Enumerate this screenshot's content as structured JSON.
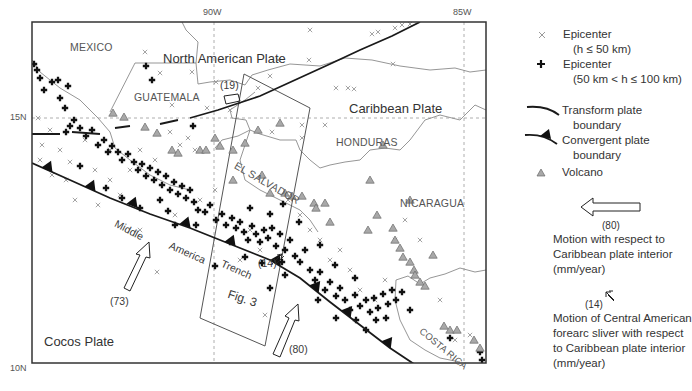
{
  "map": {
    "ticks": {
      "lon_90": "90W",
      "lon_85": "85W",
      "lat_15": "15N",
      "lat_10": "10N"
    },
    "countries": {
      "mexico": "MEXICO",
      "guatemala": "GUATEMALA",
      "honduras": "HONDURAS",
      "el_salvador": "EL SALVADOR",
      "nicaragua": "NICARAGUA",
      "costa_rica": "COSTA RICA"
    },
    "plates": {
      "north_american": "North American Plate",
      "caribbean": "Caribbean Plate",
      "cocos": "Cocos Plate"
    },
    "features": {
      "trench_word1": "Middle",
      "trench_word2": "America",
      "trench_word3": "Trench",
      "fig_box": "Fig. 3"
    },
    "annotations": {
      "rate_19": "(19)",
      "rate_14": "(14)",
      "rate_73": "(73)",
      "rate_80": "(80)"
    },
    "colors": {
      "frame": "#333333",
      "border": "#8a8a8a",
      "grid": "#999999",
      "epicenter_shallow": "#9a9a9a",
      "epicenter_deep": "#111111",
      "volcano_fill": "#a8a8a8",
      "volcano_stroke": "#666666",
      "plate_boundary": "#1a1a1a"
    }
  },
  "legend": {
    "epicenter_shallow_line1": "Epicenter",
    "epicenter_shallow_line2": "(h ≤ 50 km)",
    "epicenter_deep_line1": "Epicenter",
    "epicenter_deep_line2": "(50 km < h ≤ 100 km)",
    "transform_line1": "Transform plate",
    "transform_line2": "boundary",
    "convergent_line1": "Convergent plate",
    "convergent_line2": "boundary",
    "volcano": "Volcano",
    "motion_rate": "(80)",
    "motion_line1": "Motion with respect to",
    "motion_line2": "Caribbean plate interior",
    "motion_line3": "(mm/year)",
    "sliver_rate": "(14)",
    "sliver_line1": "Motion of Central American",
    "sliver_line2": "forearc sliver with respect",
    "sliver_line3": "to Caribbean plate interior",
    "sliver_line4": "(mm/year)"
  }
}
